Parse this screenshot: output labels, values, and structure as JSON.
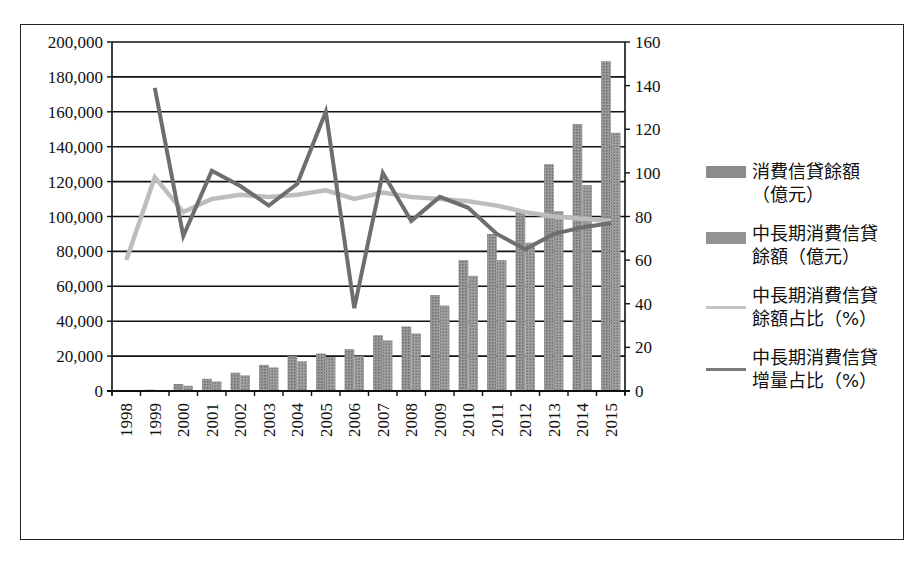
{
  "chart_data": {
    "type": "bar",
    "title": "",
    "xlabel": "",
    "ylabel": "",
    "categories": [
      "1998",
      "1999",
      "2000",
      "2001",
      "2002",
      "2003",
      "2004",
      "2005",
      "2006",
      "2007",
      "2008",
      "2009",
      "2010",
      "2011",
      "2012",
      "2013",
      "2014",
      "2015"
    ],
    "left_axis": {
      "ylim": [
        0,
        200000
      ],
      "ticks": [
        "0",
        "20,000",
        "40,000",
        "60,000",
        "80,000",
        "100,000",
        "120,000",
        "140,000",
        "160,000",
        "180,000",
        "200,000"
      ]
    },
    "right_axis": {
      "ylim": [
        0,
        160
      ],
      "ticks": [
        "0",
        "20",
        "40",
        "60",
        "80",
        "100",
        "120",
        "140",
        "160"
      ]
    },
    "grid": true,
    "legend_position": "right",
    "series": [
      {
        "name": "消費信貸餘額（億元）",
        "kind": "bar",
        "axis": "left",
        "color": "#8a8a8a",
        "values": [
          0,
          800,
          4000,
          7000,
          10500,
          15000,
          20000,
          21500,
          24000,
          32000,
          37000,
          55000,
          75000,
          90000,
          103000,
          130000,
          153000,
          189000
        ]
      },
      {
        "name": "中長期消費信貸餘額（億元）",
        "kind": "bar",
        "axis": "left",
        "color": "#8f8f8f",
        "values": [
          0,
          500,
          3000,
          5500,
          9000,
          13500,
          17000,
          19500,
          20000,
          29000,
          33000,
          49000,
          66000,
          75000,
          85000,
          103000,
          118000,
          148000
        ]
      },
      {
        "name": "中長期消費信貸餘額占比（%）",
        "kind": "line",
        "axis": "right",
        "color": "#bdbdbd",
        "values": [
          60,
          98,
          82,
          88,
          90,
          89,
          90,
          92,
          88,
          91,
          89,
          88,
          87,
          85,
          82,
          80,
          79,
          78
        ]
      },
      {
        "name": "中長期消費信貸增量占比（%）",
        "kind": "line",
        "axis": "right",
        "color": "#6e6e6e",
        "values": [
          null,
          139,
          71,
          101,
          94,
          85,
          95,
          128,
          38,
          100,
          78,
          89,
          84,
          72,
          65,
          72,
          75,
          77
        ]
      }
    ]
  },
  "legend": {
    "items": [
      {
        "label": "消費信貸餘額\n（億元）",
        "type": "bar"
      },
      {
        "label": "中長期消費信貸\n餘額（億元）",
        "type": "bar"
      },
      {
        "label": "中長期消費信貸\n餘額占比（%）",
        "type": "line-light"
      },
      {
        "label": "中長期消費信貸\n增量占比（%）",
        "type": "line-dark"
      }
    ]
  }
}
